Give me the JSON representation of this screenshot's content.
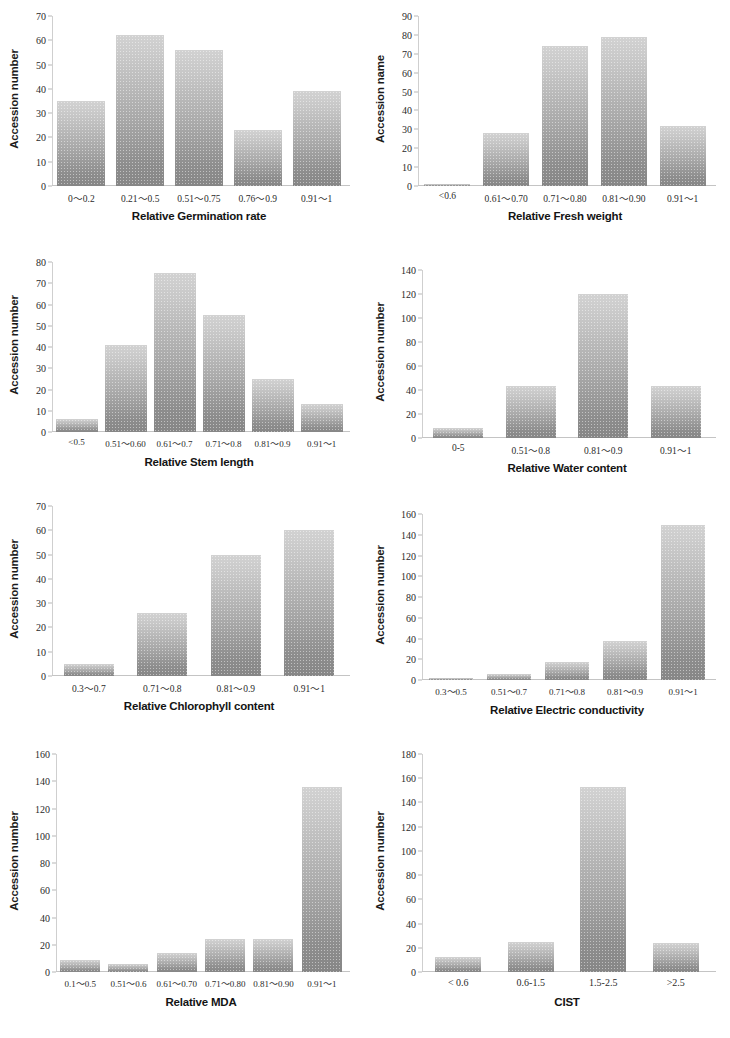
{
  "figure": {
    "background": "#ffffff",
    "bar_color_top": "#d2d2d2",
    "bar_color_bottom": "#868686",
    "axis_color": "#c4c4c4",
    "text_color": "#1b1b1b",
    "panel_count": 8,
    "columns": 2,
    "rows": 4
  },
  "chart_data": [
    {
      "id": "relative-germination-rate",
      "type": "bar",
      "title": "",
      "xlabel": "Relative Germination rate",
      "ylabel": "Accession number",
      "categories": [
        "0～0.2",
        "0.21～0.5",
        "0.51～0.75",
        "0.76～0.9",
        "0.91～1"
      ],
      "values": [
        35,
        62,
        56,
        23,
        39
      ],
      "ylim": [
        0,
        70
      ],
      "yticks": [
        0,
        10,
        20,
        30,
        40,
        50,
        60,
        70
      ],
      "grid": false,
      "legend": "none"
    },
    {
      "id": "relative-fresh-weight",
      "type": "bar",
      "title": "",
      "xlabel": "Relative Fresh weight",
      "ylabel": "Accession name",
      "categories": [
        "<0.6",
        "0.61～0.70",
        "0.71～0.80",
        "0.81～0.90",
        "0.91～1"
      ],
      "values": [
        1,
        28,
        74,
        79,
        32
      ],
      "ylim": [
        0,
        90
      ],
      "yticks": [
        0,
        10,
        20,
        30,
        40,
        50,
        60,
        70,
        80,
        90
      ],
      "grid": false,
      "legend": "none"
    },
    {
      "id": "relative-stem-length",
      "type": "bar",
      "title": "",
      "xlabel": "Relative Stem length",
      "ylabel": "Accession number",
      "categories": [
        "<0.5",
        "0.51～0.60",
        "0.61～0.7",
        "0.71～0.8",
        "0.81～0.9",
        "0.91～1"
      ],
      "values": [
        6,
        41,
        75,
        55,
        25,
        13
      ],
      "ylim": [
        0,
        80
      ],
      "yticks": [
        0,
        10,
        20,
        30,
        40,
        50,
        60,
        70,
        80
      ],
      "grid": false,
      "legend": "none"
    },
    {
      "id": "relative-water-content",
      "type": "bar",
      "title": "",
      "xlabel": "Relative Water content",
      "ylabel": "Accession number",
      "categories": [
        "0-5",
        "0.51～0.8",
        "0.81～0.9",
        "0.91～1"
      ],
      "values": [
        8,
        43,
        120,
        43
      ],
      "ylim": [
        0,
        140
      ],
      "yticks": [
        0,
        20,
        40,
        60,
        80,
        100,
        120,
        140
      ],
      "grid": false,
      "legend": "none"
    },
    {
      "id": "relative-chlorophyll-content",
      "type": "bar",
      "title": "",
      "xlabel": "Relative Chlorophyll content",
      "ylabel": "Accession number",
      "categories": [
        "0.3～0.7",
        "0.71～0.8",
        "0.81～0.9",
        "0.91～1"
      ],
      "values": [
        5,
        26,
        50,
        60
      ],
      "ylim": [
        0,
        70
      ],
      "yticks": [
        0,
        10,
        20,
        30,
        40,
        50,
        60,
        70
      ],
      "grid": false,
      "legend": "none"
    },
    {
      "id": "relative-electric-conductivity",
      "type": "bar",
      "title": "",
      "xlabel": "Relative Electric conductivity",
      "ylabel": "Accession number",
      "categories": [
        "0.3～0.5",
        "0.51～0.7",
        "0.71～0.8",
        "0.81～0.9",
        "0.91～1"
      ],
      "values": [
        2,
        6,
        17,
        38,
        149
      ],
      "ylim": [
        0,
        160
      ],
      "yticks": [
        0,
        20,
        40,
        60,
        80,
        100,
        120,
        140,
        160
      ],
      "grid": false,
      "legend": "none"
    },
    {
      "id": "relative-mda",
      "type": "bar",
      "title": "",
      "xlabel": "Relative MDA",
      "ylabel": "Accession number",
      "categories": [
        "0.1～0.5",
        "0.51～0.6",
        "0.61～0.70",
        "0.71～0.80",
        "0.81～0.90",
        "0.91～1"
      ],
      "values": [
        9,
        6,
        14,
        24,
        24,
        136
      ],
      "ylim": [
        0,
        160
      ],
      "yticks": [
        0,
        20,
        40,
        60,
        80,
        100,
        120,
        140,
        160
      ],
      "grid": false,
      "legend": "none"
    },
    {
      "id": "cist",
      "type": "bar",
      "title": "",
      "xlabel": "CIST",
      "ylabel": "Accession number",
      "categories": [
        "< 0.6",
        "0.6-1.5",
        "1.5-2.5",
        ">2.5"
      ],
      "values": [
        12,
        25,
        153,
        24
      ],
      "ylim": [
        0,
        180
      ],
      "yticks": [
        0,
        20,
        40,
        60,
        80,
        100,
        120,
        140,
        160,
        180
      ],
      "grid": false,
      "legend": "none"
    }
  ],
  "layout": [
    {
      "left": 6,
      "top": 6,
      "width": 352,
      "height": 232,
      "plot_left": 46,
      "plot_right": 12,
      "plot_top": 10,
      "plot_bottom": 52,
      "xtick_size": 9.5,
      "bar_width": 48
    },
    {
      "left": 372,
      "top": 6,
      "width": 352,
      "height": 232,
      "plot_left": 46,
      "plot_right": 12,
      "plot_top": 10,
      "plot_bottom": 52,
      "xtick_size": 9.5,
      "bar_width": 46
    },
    {
      "left": 6,
      "top": 252,
      "width": 352,
      "height": 236,
      "plot_left": 46,
      "plot_right": 12,
      "plot_top": 10,
      "plot_bottom": 56,
      "xtick_size": 9,
      "bar_width": 42
    },
    {
      "left": 372,
      "top": 260,
      "width": 352,
      "height": 240,
      "plot_left": 50,
      "plot_right": 12,
      "plot_top": 10,
      "plot_bottom": 62,
      "xtick_size": 9.5,
      "bar_width": 50
    },
    {
      "left": 6,
      "top": 496,
      "width": 352,
      "height": 240,
      "plot_left": 46,
      "plot_right": 12,
      "plot_top": 10,
      "plot_bottom": 60,
      "xtick_size": 9.5,
      "bar_width": 50
    },
    {
      "left": 372,
      "top": 504,
      "width": 352,
      "height": 234,
      "plot_left": 50,
      "plot_right": 12,
      "plot_top": 10,
      "plot_bottom": 58,
      "xtick_size": 9,
      "bar_width": 44
    },
    {
      "left": 6,
      "top": 744,
      "width": 352,
      "height": 290,
      "plot_left": 50,
      "plot_right": 12,
      "plot_top": 10,
      "plot_bottom": 62,
      "xtick_size": 9,
      "bar_width": 40
    },
    {
      "left": 372,
      "top": 744,
      "width": 352,
      "height": 290,
      "plot_left": 50,
      "plot_right": 12,
      "plot_top": 10,
      "plot_bottom": 62,
      "xtick_size": 10,
      "bar_width": 46
    }
  ]
}
